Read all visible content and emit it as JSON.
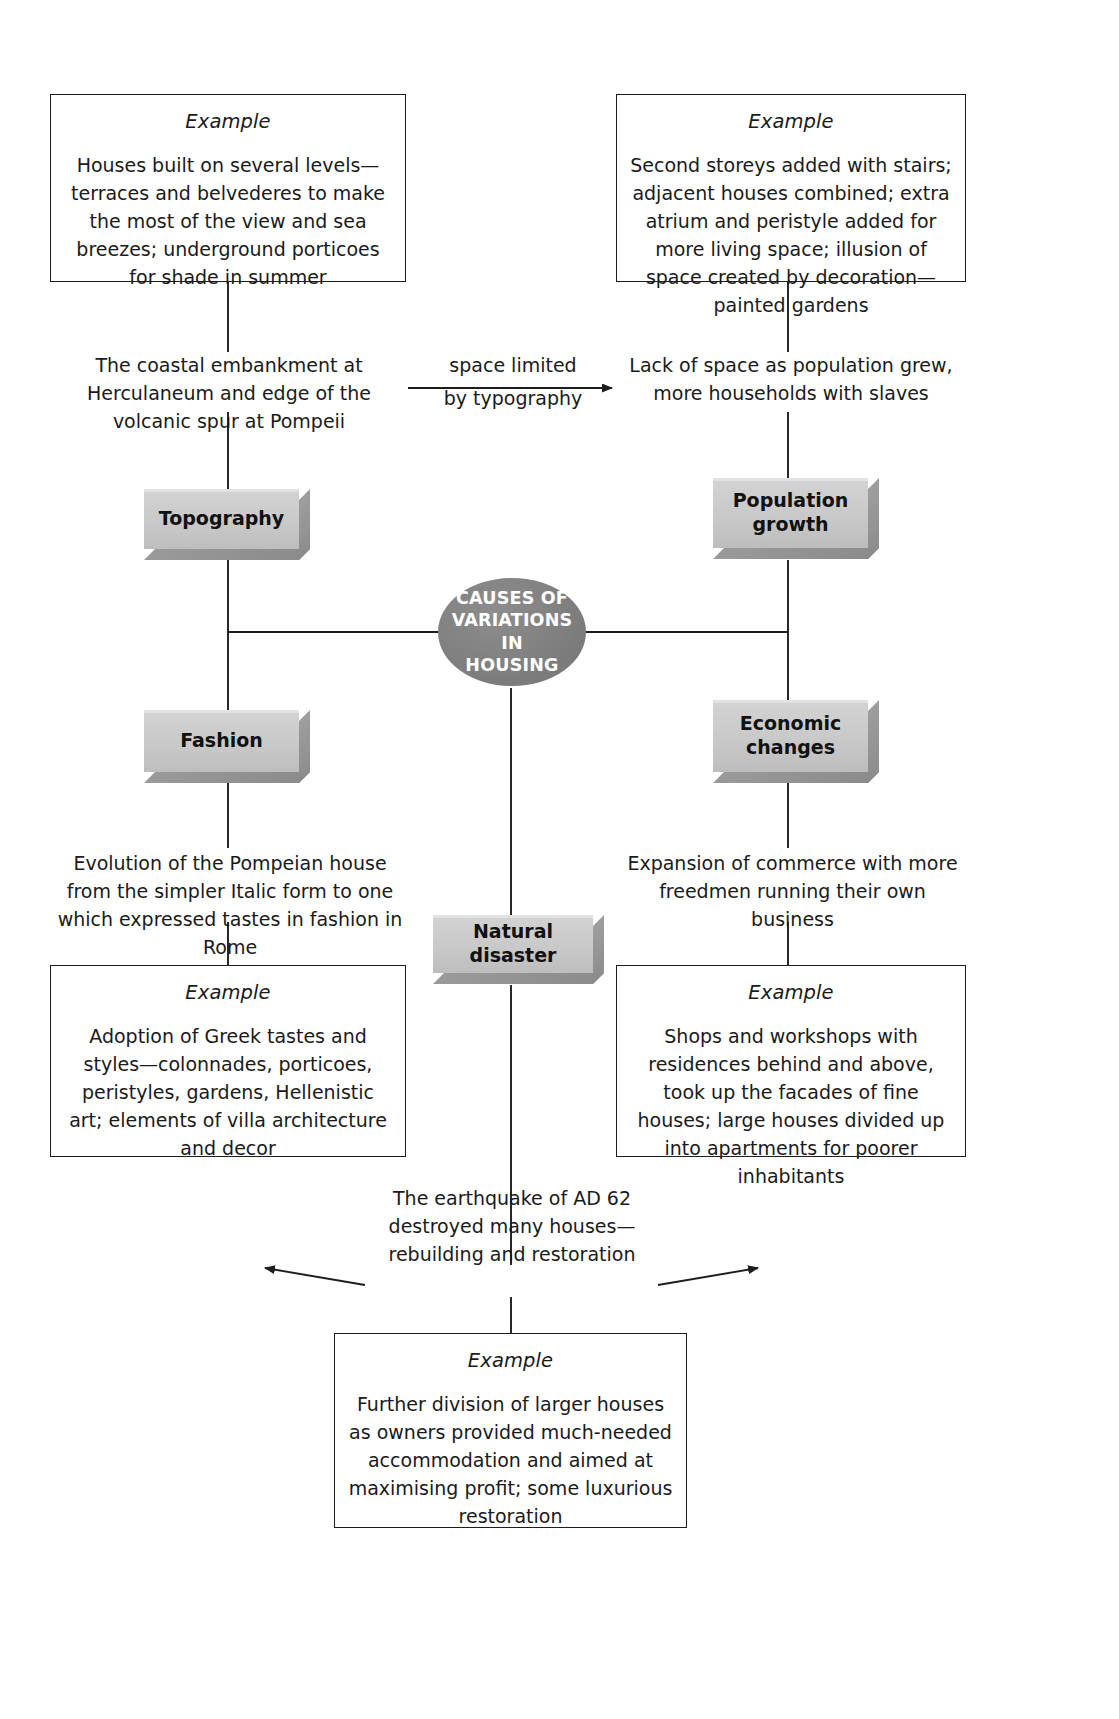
{
  "diagram": {
    "title": "CAUSES OF VARIATIONS IN HOUSING",
    "center_node": {
      "label_line1": "CAUSES OF",
      "label_line2": "VARIATIONS IN",
      "label_line3": "HOUSING"
    },
    "category_boxes": [
      {
        "id": "topography",
        "label": "Topography"
      },
      {
        "id": "population-growth",
        "label_line1": "Population",
        "label_line2": "growth"
      },
      {
        "id": "fashion",
        "label": "Fashion"
      },
      {
        "id": "economic-changes",
        "label_line1": "Economic",
        "label_line2": "changes"
      },
      {
        "id": "natural-disaster",
        "label": "Natural disaster"
      }
    ],
    "cause_texts": {
      "topography": "The coastal embankment at Herculaneum and edge of the volcanic spur at Pompeii",
      "population_growth": "Lack of space as population grew, more households with slaves",
      "fashion": "Evolution of the Pompeian house from the simpler Italic form to one which expressed tastes in fashion in Rome",
      "economic_changes": "Expansion of commerce with more freedmen running their own business",
      "natural_disaster": "The earthquake of AD 62 destroyed many houses—rebuilding and restoration"
    },
    "connector_label": {
      "line1": "space limited",
      "line2": "by typography"
    },
    "example_boxes": [
      {
        "id": "example-topography",
        "title": "Example",
        "body": "Houses built on several levels—terraces and belvederes to make the most of the view and sea breezes; underground porticoes for shade in summer"
      },
      {
        "id": "example-population-growth",
        "title": "Example",
        "body": "Second storeys added with stairs; adjacent houses combined; extra atrium and peristyle added for more living space; illusion of space created by decoration—painted gardens"
      },
      {
        "id": "example-fashion",
        "title": "Example",
        "body": "Adoption of Greek tastes and styles—colonnades, porticoes, peristyles, gardens, Hellenistic art; elements of villa architecture and decor"
      },
      {
        "id": "example-economic-changes",
        "title": "Example",
        "body": "Shops and workshops with residences behind and above, took up the facades of fine houses; large houses divided up into apartments for poorer inhabitants"
      },
      {
        "id": "example-natural-disaster",
        "title": "Example",
        "body": "Further division of larger houses as owners provided much-needed accommodation and aimed at maximising profit; some luxurious restoration"
      }
    ],
    "colors": {
      "box_border": "#1d1d1d",
      "grey_box_fill": "#c9c9c9",
      "grey_box_shadow": "#8d8d8d",
      "oval_fill": "#808080",
      "oval_text": "#ffffff",
      "line": "#1d1d1d",
      "background": "#ffffff"
    }
  }
}
